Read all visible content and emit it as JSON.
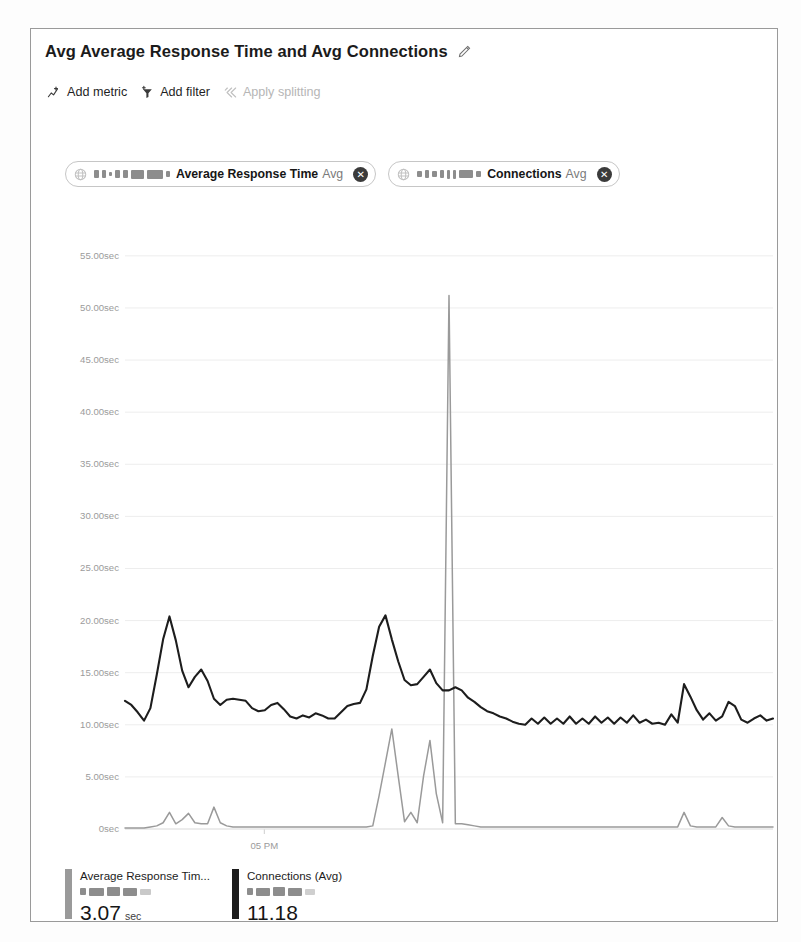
{
  "card": {
    "title": "Avg Average Response Time and Avg Connections",
    "edit_icon": "pencil-icon"
  },
  "toolbar": {
    "items": [
      {
        "label": "Add metric",
        "icon": "add-metric-icon",
        "disabled": false
      },
      {
        "label": "Add filter",
        "icon": "add-filter-icon",
        "disabled": false
      },
      {
        "label": "Apply splitting",
        "icon": "apply-splitting-icon",
        "disabled": true
      }
    ]
  },
  "metric_chips": [
    {
      "resource_icon": "resource-icon",
      "resource_name_redacted": true,
      "metric": "Average Response Time",
      "aggregation": "Avg",
      "remove_label": "✕"
    },
    {
      "resource_icon": "resource-icon",
      "resource_name_redacted": true,
      "metric": "Connections",
      "aggregation": "Avg",
      "remove_label": "✕"
    }
  ],
  "legend": [
    {
      "title": "Average Response Tim...",
      "subtitle_redacted": true,
      "value": "3.07",
      "unit": "sec",
      "color": "#9a9a9a"
    },
    {
      "title": "Connections (Avg)",
      "subtitle_redacted": true,
      "value": "11.18",
      "unit": "",
      "color": "#1d1d1d"
    }
  ],
  "colors": {
    "series_response_time": "#1d1d1d",
    "series_connections": "#9a9a9a",
    "gridline": "#ededed",
    "axis_text": "#9b9b9b",
    "card_border": "#9a9a9a"
  },
  "chart_data": {
    "type": "line",
    "title": "Avg Average Response Time and Avg Connections",
    "xlabel": "",
    "ylabel": "",
    "ylim": [
      0,
      57
    ],
    "grid": true,
    "legend_position": "bottom",
    "ytick_labels": [
      "55.00sec",
      "50.00sec",
      "45.00sec",
      "40.00sec",
      "35.00sec",
      "30.00sec",
      "25.00sec",
      "20.00sec",
      "15.00sec",
      "10.00sec",
      "5.00sec",
      "0sec"
    ],
    "ytick_values": [
      55,
      50,
      45,
      40,
      35,
      30,
      25,
      20,
      15,
      10,
      5,
      0
    ],
    "xtick_labels": [
      "05 PM"
    ],
    "xtick_positions": [
      0.215
    ],
    "series": [
      {
        "name": "Average Response Time (Avg)",
        "color": "#1d1d1d",
        "unit": "sec",
        "current_value": 3.07,
        "values": [
          12.3,
          11.9,
          11.2,
          10.4,
          11.6,
          14.8,
          18.2,
          20.4,
          18.1,
          15.2,
          13.6,
          14.6,
          15.3,
          14.2,
          12.5,
          11.9,
          12.4,
          12.5,
          12.4,
          12.3,
          11.6,
          11.3,
          11.4,
          11.9,
          12.1,
          11.5,
          10.8,
          10.6,
          10.9,
          10.7,
          11.1,
          10.9,
          10.6,
          10.6,
          11.2,
          11.8,
          12.0,
          12.1,
          13.4,
          16.6,
          19.4,
          20.5,
          18.2,
          16.1,
          14.3,
          13.8,
          13.9,
          14.6,
          15.3,
          14.0,
          13.3,
          13.3,
          13.6,
          13.3,
          12.6,
          12.2,
          11.7,
          11.3,
          11.1,
          10.8,
          10.6,
          10.3,
          10.1,
          10.0,
          10.6,
          10.1,
          10.7,
          10.1,
          10.6,
          10.1,
          10.8,
          10.1,
          10.6,
          10.1,
          10.8,
          10.2,
          10.7,
          10.1,
          10.7,
          10.2,
          10.9,
          10.2,
          10.5,
          10.1,
          10.2,
          10.0,
          11.0,
          10.2,
          13.9,
          12.7,
          11.4,
          10.5,
          11.1,
          10.4,
          10.8,
          12.2,
          11.8,
          10.5,
          10.2,
          10.6,
          10.9,
          10.4,
          10.6
        ]
      },
      {
        "name": "Connections (Avg)",
        "color": "#9a9a9a",
        "unit": "",
        "current_value": 11.18,
        "values": [
          0.1,
          0.1,
          0.1,
          0.1,
          0.2,
          0.3,
          0.6,
          1.6,
          0.5,
          0.9,
          1.5,
          0.6,
          0.5,
          0.5,
          2.1,
          0.6,
          0.3,
          0.2,
          0.2,
          0.2,
          0.2,
          0.2,
          0.2,
          0.2,
          0.2,
          0.2,
          0.2,
          0.2,
          0.2,
          0.2,
          0.2,
          0.2,
          0.2,
          0.2,
          0.2,
          0.2,
          0.2,
          0.2,
          0.2,
          0.3,
          3.2,
          6.4,
          9.6,
          5.1,
          0.7,
          1.6,
          0.6,
          5.1,
          8.5,
          3.4,
          0.6,
          51.2,
          0.5,
          0.5,
          0.4,
          0.3,
          0.2,
          0.2,
          0.2,
          0.2,
          0.2,
          0.2,
          0.2,
          0.2,
          0.2,
          0.2,
          0.2,
          0.2,
          0.2,
          0.2,
          0.2,
          0.2,
          0.2,
          0.2,
          0.2,
          0.2,
          0.2,
          0.2,
          0.2,
          0.2,
          0.2,
          0.2,
          0.2,
          0.2,
          0.2,
          0.2,
          0.2,
          0.2,
          1.6,
          0.3,
          0.2,
          0.2,
          0.2,
          0.2,
          1.1,
          0.3,
          0.2,
          0.2,
          0.2,
          0.2,
          0.2,
          0.2,
          0.2
        ]
      }
    ]
  }
}
